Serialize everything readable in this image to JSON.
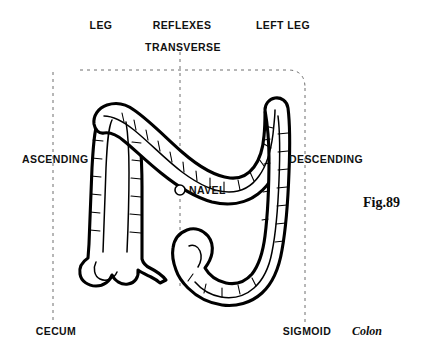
{
  "figure": {
    "title_label": "Fig.89",
    "organ_caption": "Colon",
    "background_color": "#ffffff",
    "ink_color": "#000000",
    "guide_color": "#6e6e6e"
  },
  "labels": {
    "leg": "LEG",
    "reflexes": "REFLEXES",
    "left_leg": "LEFT LEG",
    "transverse": "TRANSVERSE",
    "ascending": "ASCENDING",
    "descending": "DESCENDING",
    "navel": "NAVEL",
    "cecum": "CECUM",
    "sigmoid": "SIGMOID"
  },
  "markers": {
    "navel_icon": "navel-circle-marker"
  },
  "guides": {
    "vertical_left_x": 53,
    "vertical_center_x": 180,
    "vertical_right_x": 305,
    "horizontal_y": 70
  }
}
